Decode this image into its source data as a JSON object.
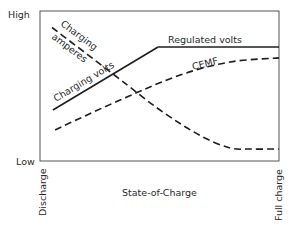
{
  "chart_data": {
    "type": "line",
    "title": "",
    "xlabel": "State-of-Charge",
    "ylabel": "",
    "xlim": [
      0,
      1
    ],
    "ylim": [
      0,
      1
    ],
    "grid": false,
    "y_tick_labels": {
      "low": "Low",
      "high": "High"
    },
    "x_tick_labels": {
      "start": "Discharge",
      "end": "Full charge"
    },
    "series": [
      {
        "name": "Charging volts",
        "style": "solid",
        "label": "Charging volts",
        "points": [
          [
            0.054,
            0.34
          ],
          [
            0.494,
            0.76
          ]
        ]
      },
      {
        "name": "Regulated volts",
        "style": "solid",
        "label": "Regulated volts",
        "points": [
          [
            0.494,
            0.76
          ],
          [
            1.0,
            0.76
          ]
        ]
      },
      {
        "name": "Charging amperes",
        "style": "dashed",
        "label_line1": "Charging",
        "label_line2": "amperes",
        "points": [
          [
            0.05,
            0.89
          ],
          [
            0.314,
            0.57
          ],
          [
            0.502,
            0.34
          ],
          [
            0.67,
            0.17
          ],
          [
            0.795,
            0.087
          ],
          [
            0.88,
            0.08
          ],
          [
            1.0,
            0.08
          ]
        ]
      },
      {
        "name": "CEMF",
        "style": "dashed",
        "label": "CEMF",
        "points": [
          [
            0.063,
            0.207
          ],
          [
            0.335,
            0.407
          ],
          [
            0.586,
            0.573
          ],
          [
            0.795,
            0.66
          ],
          [
            1.0,
            0.687
          ]
        ]
      }
    ]
  }
}
